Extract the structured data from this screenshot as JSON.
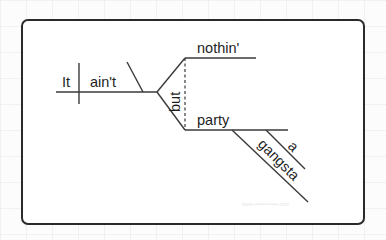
{
  "diagram": {
    "type": "sentence-diagram",
    "sentence": "It ain't nothin' but a gangsta party",
    "subject": "It",
    "verb": "ain't",
    "conjunction": "but",
    "compound_objects": [
      "nothin'",
      "party"
    ],
    "modifiers_of_party": [
      "a",
      "gangsta"
    ],
    "watermark": "www.••••••••••••••.com"
  }
}
